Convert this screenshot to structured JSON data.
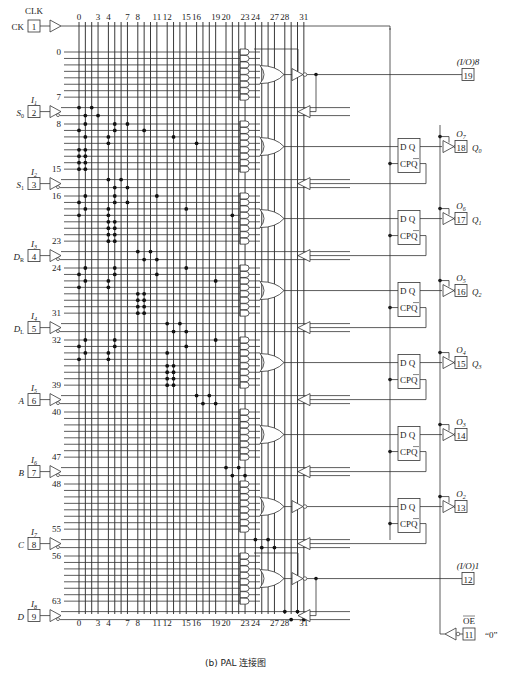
{
  "caption": "(b) PAL 连接图",
  "clock": {
    "top_label": "CLK",
    "side_label": "CK",
    "pin": "1"
  },
  "column_labels": [
    "0",
    "3",
    "4",
    "7",
    "8",
    "11",
    "12",
    "15",
    "16",
    "19",
    "20",
    "23",
    "24",
    "27",
    "28",
    "31"
  ],
  "column_label_indices": [
    0,
    3,
    4,
    7,
    8,
    11,
    12,
    15,
    16,
    19,
    20,
    23,
    24,
    27,
    28,
    31
  ],
  "inputs": [
    {
      "id": "I1",
      "name": "S0",
      "pin": "2",
      "sub": "1",
      "name_main": "S",
      "name_sub": "0"
    },
    {
      "id": "I2",
      "name": "S1",
      "pin": "3",
      "sub": "2",
      "name_main": "S",
      "name_sub": "1"
    },
    {
      "id": "I3",
      "name": "DR",
      "pin": "4",
      "sub": "3",
      "name_main": "D",
      "name_sub": "R"
    },
    {
      "id": "I4",
      "name": "DL",
      "pin": "5",
      "sub": "4",
      "name_main": "D",
      "name_sub": "L"
    },
    {
      "id": "I5",
      "name": "A",
      "pin": "6",
      "sub": "5",
      "name_main": "A",
      "name_sub": ""
    },
    {
      "id": "I6",
      "name": "B",
      "pin": "7",
      "sub": "6",
      "name_main": "B",
      "name_sub": ""
    },
    {
      "id": "I7",
      "name": "C",
      "pin": "8",
      "sub": "7",
      "name_main": "C",
      "name_sub": ""
    },
    {
      "id": "I8",
      "name": "D",
      "pin": "9",
      "sub": "8",
      "name_main": "D",
      "name_sub": ""
    }
  ],
  "row_labels": [
    {
      "text": "0",
      "row": 0
    },
    {
      "text": "7",
      "row": 7
    },
    {
      "text": "8",
      "row": 8
    },
    {
      "text": "15",
      "row": 15
    },
    {
      "text": "16",
      "row": 16
    },
    {
      "text": "23",
      "row": 23
    },
    {
      "text": "24",
      "row": 24
    },
    {
      "text": "31",
      "row": 31
    },
    {
      "text": "32",
      "row": 32
    },
    {
      "text": "39",
      "row": 39
    },
    {
      "text": "40",
      "row": 40
    },
    {
      "text": "47",
      "row": 47
    },
    {
      "text": "48",
      "row": 48
    },
    {
      "text": "55",
      "row": 55
    },
    {
      "text": "56",
      "row": 56
    },
    {
      "text": "63",
      "row": 63
    }
  ],
  "outputs": [
    {
      "pin": "19",
      "label": "(I/O)8",
      "type": "io"
    },
    {
      "pin": "18",
      "label": "O7",
      "q": "Q0",
      "type": "reg"
    },
    {
      "pin": "17",
      "label": "O6",
      "q": "Q1",
      "type": "reg"
    },
    {
      "pin": "16",
      "label": "O5",
      "q": "Q2",
      "type": "reg"
    },
    {
      "pin": "15",
      "label": "O4",
      "q": "Q3",
      "type": "reg"
    },
    {
      "pin": "14",
      "label": "O3",
      "q": "",
      "type": "reg"
    },
    {
      "pin": "13",
      "label": "O2",
      "q": "",
      "type": "reg"
    },
    {
      "pin": "12",
      "label": "(I/O)1",
      "type": "io"
    }
  ],
  "oe": {
    "pin": "11",
    "label": "OE",
    "value": "“0”"
  },
  "flipflop": {
    "d": "D",
    "q": "Q",
    "cp": "CP",
    "qbar": "Q"
  },
  "fuses": [
    {
      "r": "in1",
      "c": 0
    },
    {
      "r": "in1",
      "c": 2
    },
    {
      "r": "in1n",
      "c": 1
    },
    {
      "r": "in1n",
      "c": 3
    },
    {
      "r": 8,
      "c": 1
    },
    {
      "r": 8,
      "c": 5
    },
    {
      "r": 8,
      "c": 7
    },
    {
      "r": 9,
      "c": 0
    },
    {
      "r": 9,
      "c": 5
    },
    {
      "r": 9,
      "c": 9
    },
    {
      "r": 10,
      "c": 1
    },
    {
      "r": 10,
      "c": 4
    },
    {
      "r": 10,
      "c": 13
    },
    {
      "r": 11,
      "c": 4
    },
    {
      "r": 11,
      "c": 16
    },
    {
      "r": 12,
      "c": 0
    },
    {
      "r": 12,
      "c": 1
    },
    {
      "r": 13,
      "c": 0
    },
    {
      "r": 13,
      "c": 1
    },
    {
      "r": 14,
      "c": 0
    },
    {
      "r": 14,
      "c": 1
    },
    {
      "r": 15,
      "c": 0
    },
    {
      "r": 15,
      "c": 1
    },
    {
      "r": "in2",
      "c": 4
    },
    {
      "r": "in2",
      "c": 6
    },
    {
      "r": "in2n",
      "c": 5
    },
    {
      "r": "in2n",
      "c": 7
    },
    {
      "r": 16,
      "c": 1
    },
    {
      "r": 16,
      "c": 5
    },
    {
      "r": 16,
      "c": 11
    },
    {
      "r": 17,
      "c": 0
    },
    {
      "r": 17,
      "c": 5
    },
    {
      "r": 17,
      "c": 7
    },
    {
      "r": 18,
      "c": 1
    },
    {
      "r": 18,
      "c": 4
    },
    {
      "r": 18,
      "c": 15
    },
    {
      "r": 19,
      "c": 0
    },
    {
      "r": 19,
      "c": 4
    },
    {
      "r": 19,
      "c": 21
    },
    {
      "r": 20,
      "c": 4
    },
    {
      "r": 20,
      "c": 5
    },
    {
      "r": 21,
      "c": 4
    },
    {
      "r": 21,
      "c": 5
    },
    {
      "r": 22,
      "c": 4
    },
    {
      "r": 22,
      "c": 5
    },
    {
      "r": 23,
      "c": 4
    },
    {
      "r": 23,
      "c": 5
    },
    {
      "r": "in3",
      "c": 8
    },
    {
      "r": "in3",
      "c": 10
    },
    {
      "r": "in3n",
      "c": 9
    },
    {
      "r": "in3n",
      "c": 11
    },
    {
      "r": 24,
      "c": 1
    },
    {
      "r": 24,
      "c": 5
    },
    {
      "r": 24,
      "c": 15
    },
    {
      "r": 25,
      "c": 0
    },
    {
      "r": 25,
      "c": 5
    },
    {
      "r": 25,
      "c": 11
    },
    {
      "r": 26,
      "c": 1
    },
    {
      "r": 26,
      "c": 4
    },
    {
      "r": 26,
      "c": 19
    },
    {
      "r": 27,
      "c": 0
    },
    {
      "r": 27,
      "c": 4
    },
    {
      "r": 28,
      "c": 8
    },
    {
      "r": 28,
      "c": 9
    },
    {
      "r": 29,
      "c": 8
    },
    {
      "r": 29,
      "c": 9
    },
    {
      "r": 30,
      "c": 8
    },
    {
      "r": 30,
      "c": 9
    },
    {
      "r": 31,
      "c": 8
    },
    {
      "r": 31,
      "c": 9
    },
    {
      "r": "in4",
      "c": 12
    },
    {
      "r": "in4",
      "c": 14
    },
    {
      "r": "in4n",
      "c": 13
    },
    {
      "r": "in4n",
      "c": 15
    },
    {
      "r": 32,
      "c": 1
    },
    {
      "r": 32,
      "c": 5
    },
    {
      "r": 32,
      "c": 19
    },
    {
      "r": 33,
      "c": 0
    },
    {
      "r": 33,
      "c": 5
    },
    {
      "r": 33,
      "c": 15
    },
    {
      "r": 34,
      "c": 1
    },
    {
      "r": 34,
      "c": 4
    },
    {
      "r": 34,
      "c": 12
    },
    {
      "r": 35,
      "c": 0
    },
    {
      "r": 35,
      "c": 4
    },
    {
      "r": 35,
      "c": 27
    },
    {
      "r": 36,
      "c": 12
    },
    {
      "r": 36,
      "c": 13
    },
    {
      "r": 37,
      "c": 12
    },
    {
      "r": 37,
      "c": 13
    },
    {
      "r": 38,
      "c": 12
    },
    {
      "r": 38,
      "c": 13
    },
    {
      "r": 39,
      "c": 12
    },
    {
      "r": 39,
      "c": 13
    },
    {
      "r": "in5",
      "c": 16
    },
    {
      "r": "in5",
      "c": 18
    },
    {
      "r": "in5n",
      "c": 17
    },
    {
      "r": "in5n",
      "c": 19
    },
    {
      "r": "in6",
      "c": 20
    },
    {
      "r": "in6",
      "c": 22
    },
    {
      "r": "in6n",
      "c": 21
    },
    {
      "r": "in6n",
      "c": 23
    },
    {
      "r": "in7",
      "c": 24
    },
    {
      "r": "in7",
      "c": 26
    },
    {
      "r": "in7n",
      "c": 25
    },
    {
      "r": "in7n",
      "c": 27
    },
    {
      "r": "in8",
      "c": 28
    },
    {
      "r": "in8",
      "c": 30
    },
    {
      "r": "in8n",
      "c": 29
    },
    {
      "r": "in8n",
      "c": 31
    }
  ]
}
